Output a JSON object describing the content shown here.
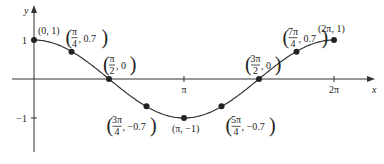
{
  "chart_data": {
    "type": "line",
    "title": "",
    "function": "cos(x)",
    "xlabel": "x",
    "ylabel": "y",
    "xlim": [
      0,
      6.2832
    ],
    "ylim": [
      -1,
      1
    ],
    "grid": false,
    "x_ticks": [
      {
        "value": 3.14159,
        "label": "π"
      },
      {
        "value": 6.28319,
        "label": "2π"
      }
    ],
    "y_ticks": [
      {
        "value": 1,
        "label": "1"
      },
      {
        "value": -1,
        "label": "−1"
      }
    ],
    "points": [
      {
        "x": 0,
        "y": 1,
        "label_num": "",
        "label_den": "",
        "label_x": "0",
        "label_y": "1",
        "frac": false,
        "pos": "above-right"
      },
      {
        "x": 0.7854,
        "y": 0.7,
        "label_num": "π",
        "label_den": "4",
        "label_y": "0.7",
        "frac": true,
        "pos": "above"
      },
      {
        "x": 1.5708,
        "y": 0,
        "label_num": "π",
        "label_den": "2",
        "label_y": "0",
        "frac": true,
        "pos": "above"
      },
      {
        "x": 2.3562,
        "y": -0.7,
        "label_num": "3π",
        "label_den": "4",
        "label_y": "−0.7",
        "frac": true,
        "pos": "below-left"
      },
      {
        "x": 3.14159,
        "y": -1,
        "label_num": "",
        "label_den": "",
        "label_x": "π",
        "label_y": "−1",
        "frac": false,
        "pos": "below"
      },
      {
        "x": 3.927,
        "y": -0.7,
        "label_num": "5π",
        "label_den": "4",
        "label_y": "−0.7",
        "frac": true,
        "pos": "below-right"
      },
      {
        "x": 4.7124,
        "y": 0,
        "label_num": "3π",
        "label_den": "2",
        "label_y": "0",
        "frac": true,
        "pos": "above-left"
      },
      {
        "x": 5.4978,
        "y": 0.7,
        "label_num": "7π",
        "label_den": "4",
        "label_y": "0.7",
        "frac": true,
        "pos": "above-left"
      },
      {
        "x": 6.28319,
        "y": 1,
        "label_num": "",
        "label_den": "",
        "label_x": "2π",
        "label_y": "1",
        "frac": false,
        "pos": "above"
      }
    ]
  }
}
